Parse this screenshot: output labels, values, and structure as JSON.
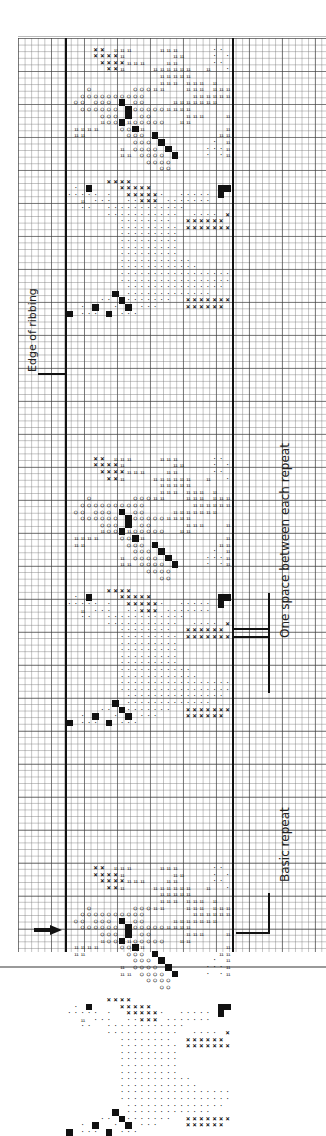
{
  "annotations": {
    "left_label": "Edge of ribbing",
    "right_top_label": "One space between each repeat",
    "right_bottom_label": "Basic repeat",
    "start_arrow": "arrow-right"
  },
  "legend_symbols": {
    "fill": "solid black square",
    "x": "cross stitch X",
    "o": "circle",
    "dot": "dot",
    "h": "double tick"
  },
  "layout": {
    "grid_cell_px": 6.6,
    "major_grid_every": 5,
    "chart_left_x": 66,
    "chart_right_x": 233,
    "repeat_height_cells": 62,
    "repeat_count_visible": 3
  },
  "motif": {
    "rows": [
      "...........................",
      "....XX.hhh....hhh.....dd.hhh",
      "....XXXXh.......hh....d.d.dh",
      ".....XXXXhhh...hh.....dd.d.h",
      "......XXh....hhhhhh..h..dhhhh",
      "..............hhhhh.......hh",
      "..............hhh.hhh.h.....",
      "...O......OOOhh...hhh.hhhhhh",
      "..OOOOOOOOOO.......hhhhhhhh.",
      ".OO.OOO.F.OO....hhhhhhh.....",
      "..OOOOOO.FOOOOOhhhh.........",
      ".....OOO.F.OO.....hhh...hhhh",
      ".....hOOFhOOOOO..hh......hhh",
      ".hhhh...OOFh............hhh.",
      ".hh......OOO.F.........hhhh.",
      "..........OOO.F.......d.h..h",
      "........h.OOOO.F.....dddh.hh",
      "........hh.OOOO.F....d.dh.hh",
      "............OOOO.........hh.",
      "..............OO.........h..",
      "...........................",
      "......XXXX..................",
      ".d.F....XXXXX..........FF...",
      "ddddd.d..XXXXXd..ddddd.F....",
      "..h.ddd..ddXXX.ddddddd......",
      "..dd..dddddddddddd..........",
      "......ddddddddddd..dddd.XX..",
      "........dddddddd..XXXXXX....",
      "........ddddddddd.XXXXXXX...",
      "........ddddddddd...........",
      "........ddddddddd...........",
      "........ddddddddd...........",
      "........ddddddddd...........",
      "........ddddddddddd.........",
      "........dddddddddddd.....F..",
      "........dddddddddddddddddF..",
      "........ddddddddddddddddd...",
      ".........ddddddddddddddd....",
      ".......F.ddddddddddddd...F..",
      ".....dd.Fddddddd..XXXXXXXX..",
      "..d.F..d.F.ddd....XXXXXX....",
      "F.ddd.F.ddd.................."
    ]
  }
}
